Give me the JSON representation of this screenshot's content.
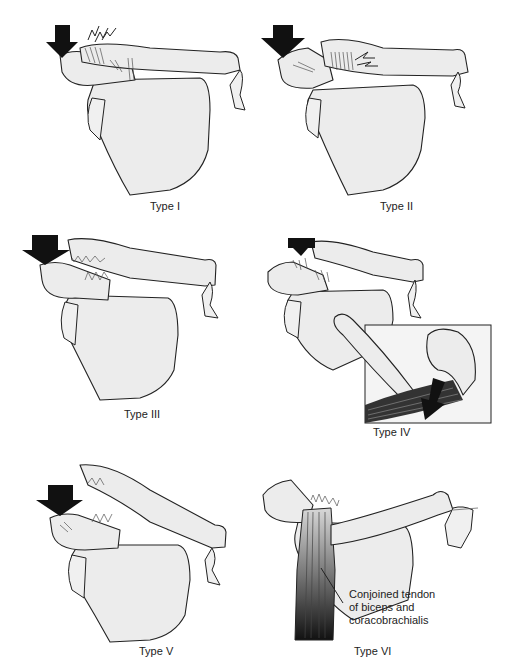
{
  "figure": {
    "panels": [
      {
        "id": "type-1",
        "caption": "Type I"
      },
      {
        "id": "type-2",
        "caption": "Type II"
      },
      {
        "id": "type-3",
        "caption": "Type III"
      },
      {
        "id": "type-4",
        "caption": "Type IV"
      },
      {
        "id": "type-5",
        "caption": "Type V"
      },
      {
        "id": "type-6",
        "caption": "Type VI",
        "annotation": [
          "Conjoined tendon",
          "of biceps and",
          "coracobrachialis"
        ]
      }
    ]
  }
}
